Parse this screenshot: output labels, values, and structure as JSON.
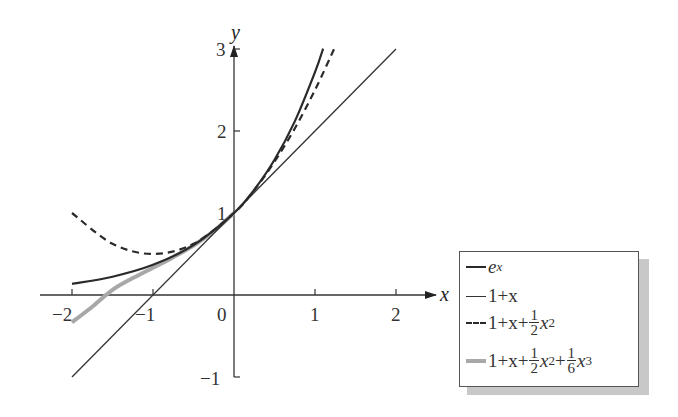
{
  "chart_data": {
    "type": "line",
    "title": "",
    "xlabel": "x",
    "ylabel": "y",
    "xlim": [
      -2.4,
      2.5
    ],
    "ylim": [
      -1.1,
      3.05
    ],
    "grid": false,
    "legend_position": "lower right, outside plot area",
    "x_ticks": [
      -2,
      -1,
      0,
      1,
      2
    ],
    "x_tick_labels": [
      "−2",
      "−1",
      "0",
      "1",
      "2"
    ],
    "y_ticks": [
      -1,
      1,
      2,
      3
    ],
    "y_tick_labels": [
      "−1",
      "1",
      "2",
      "3"
    ],
    "series": [
      {
        "name": "e^x",
        "style": "solid",
        "color": "#2a2a2a",
        "width": 2.2,
        "x": [
          -2,
          -1.5,
          -1,
          -0.5,
          0,
          0.25,
          0.5,
          0.75,
          1,
          1.1
        ],
        "y": [
          0.135,
          0.223,
          0.368,
          0.607,
          1,
          1.284,
          1.649,
          2.117,
          2.718,
          3.004
        ]
      },
      {
        "name": "1+x",
        "style": "solid",
        "color": "#333333",
        "width": 1.3,
        "x": [
          -2,
          2
        ],
        "y": [
          -1,
          3
        ]
      },
      {
        "name": "1+x+½x²",
        "style": "dashed",
        "color": "#2a2a2a",
        "width": 2.2,
        "x": [
          -2,
          -1.5,
          -1,
          -0.5,
          0,
          0.25,
          0.5,
          0.75,
          1,
          1.236
        ],
        "y": [
          1,
          0.625,
          0.5,
          0.625,
          1,
          1.281,
          1.625,
          2.031,
          2.5,
          3.0
        ]
      },
      {
        "name": "1+x+½x²+⅙x³",
        "style": "solid",
        "color": "#a8a8a8",
        "width": 4,
        "x": [
          -2,
          -1.75,
          -1.5,
          -1.25,
          -1,
          -0.75,
          -0.5,
          -0.25,
          0
        ],
        "y": [
          -0.333,
          -0.143,
          0.063,
          0.206,
          0.333,
          0.461,
          0.604,
          0.779,
          1
        ]
      }
    ]
  },
  "axes": {
    "x_name": "x",
    "y_name": "y",
    "origin_label": "0"
  },
  "legend": {
    "items": [
      {
        "label_main": "e",
        "label_sup": "x"
      },
      {
        "label_main": "1+x"
      },
      {
        "label_pre": "1+x+",
        "frac_num": "1",
        "frac_den": "2",
        "label_post": "x",
        "post_sup": "2"
      },
      {
        "label_pre": "1+x+",
        "frac_num": "1",
        "frac_den": "2",
        "label_mid": "x",
        "mid_sup": "2",
        "label_mid2": "+",
        "frac2_num": "1",
        "frac2_den": "6",
        "label_post": "x",
        "post_sup": "3"
      }
    ]
  }
}
